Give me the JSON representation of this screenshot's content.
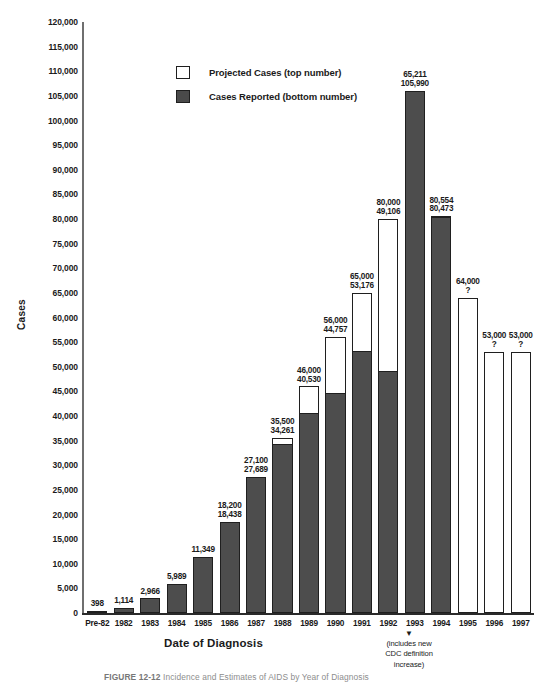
{
  "chart_data": {
    "type": "bar",
    "title": "",
    "xlabel": "Date of Diagnosis",
    "ylabel": "Cases",
    "ylim": [
      0,
      120000
    ],
    "ytick_step": 5000,
    "grid": false,
    "legend_position": "top-center",
    "stacked": true,
    "categories": [
      "Pre-82",
      "1982",
      "1983",
      "1984",
      "1985",
      "1986",
      "1987",
      "1988",
      "1989",
      "1990",
      "1991",
      "1992",
      "1993",
      "1994",
      "1995",
      "1996",
      "1997"
    ],
    "series": [
      {
        "name": "Projected Cases (top number)",
        "color": "#ffffff",
        "values": [
          null,
          null,
          null,
          null,
          null,
          18200,
          27100,
          35500,
          46000,
          56000,
          65000,
          80000,
          65211,
          80554,
          64000,
          53000,
          53000
        ]
      },
      {
        "name": "Cases Reported (bottom number)",
        "color": "#4a4a4a",
        "values": [
          398,
          1114,
          2966,
          5989,
          11349,
          18438,
          27689,
          34261,
          40530,
          44757,
          53176,
          49106,
          105990,
          80473,
          null,
          null,
          null
        ]
      }
    ],
    "bars": [
      {
        "category": "Pre-82",
        "projected_label": "",
        "reported_label": "398",
        "projected": null,
        "reported": 398
      },
      {
        "category": "1982",
        "projected_label": "",
        "reported_label": "1,114",
        "projected": null,
        "reported": 1114
      },
      {
        "category": "1983",
        "projected_label": "",
        "reported_label": "2,966",
        "projected": null,
        "reported": 2966
      },
      {
        "category": "1984",
        "projected_label": "",
        "reported_label": "5,989",
        "projected": null,
        "reported": 5989
      },
      {
        "category": "1985",
        "projected_label": "",
        "reported_label": "11,349",
        "projected": null,
        "reported": 11349
      },
      {
        "category": "1986",
        "projected_label": "18,200",
        "reported_label": "18,438",
        "projected": 18200,
        "reported": 18438
      },
      {
        "category": "1987",
        "projected_label": "27,100",
        "reported_label": "27,689",
        "projected": 27100,
        "reported": 27689
      },
      {
        "category": "1988",
        "projected_label": "35,500",
        "reported_label": "34,261",
        "projected": 35500,
        "reported": 34261
      },
      {
        "category": "1989",
        "projected_label": "46,000",
        "reported_label": "40,530",
        "projected": 46000,
        "reported": 40530
      },
      {
        "category": "1990",
        "projected_label": "56,000",
        "reported_label": "44,757",
        "projected": 56000,
        "reported": 44757
      },
      {
        "category": "1991",
        "projected_label": "65,000",
        "reported_label": "53,176",
        "projected": 65000,
        "reported": 53176
      },
      {
        "category": "1992",
        "projected_label": "80,000",
        "reported_label": "49,106",
        "projected": 80000,
        "reported": 49106
      },
      {
        "category": "1993",
        "projected_label": "65,211",
        "reported_label": "105,990",
        "projected": 65211,
        "reported": 105990
      },
      {
        "category": "1994",
        "projected_label": "80,554",
        "reported_label": "80,473",
        "projected": 80554,
        "reported": 80473
      },
      {
        "category": "1995",
        "projected_label": "64,000",
        "reported_label": "?",
        "projected": 64000,
        "reported": null
      },
      {
        "category": "1996",
        "projected_label": "53,000",
        "reported_label": "?",
        "projected": 53000,
        "reported": null
      },
      {
        "category": "1997",
        "projected_label": "53,000",
        "reported_label": "?",
        "projected": 53000,
        "reported": null
      }
    ],
    "yticks": [
      "0",
      "5,000",
      "10,000",
      "15,000",
      "20,000",
      "25,000",
      "30,000",
      "35,000",
      "40,000",
      "45,000",
      "50,000",
      "55,000",
      "60,000",
      "65,000",
      "70,000",
      "75,000",
      "80,000",
      "85,000",
      "90,000",
      "95,000",
      "100,000",
      "105,000",
      "110,000",
      "115,000",
      "120,000"
    ],
    "annotations": [
      {
        "name": "cdc-definition-note",
        "target": "1993",
        "arrow": "▼",
        "lines": [
          "(includes new",
          "CDC definition",
          "increase)"
        ]
      }
    ]
  },
  "legend": {
    "items": [
      {
        "label": "Projected Cases (top number)",
        "swatch": "projected"
      },
      {
        "label": "Cases Reported (bottom number)",
        "swatch": "reported"
      }
    ]
  },
  "caption": {
    "figure_number": "FIGURE 12-12",
    "text": "Incidence and Estimates of AIDS by Year of Diagnosis"
  }
}
